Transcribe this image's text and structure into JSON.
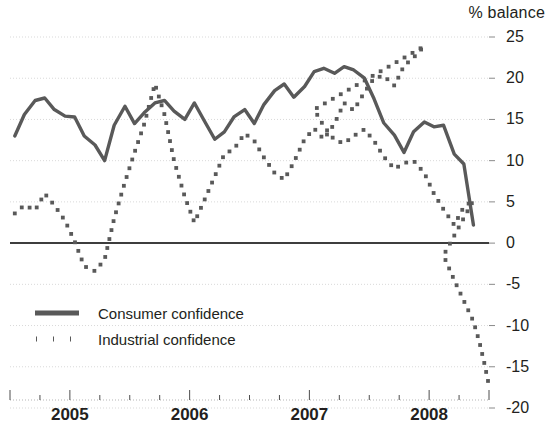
{
  "chart_data": {
    "type": "line",
    "title": "",
    "subtitle": "",
    "xlabel": "",
    "ylabel": "% balance",
    "unit_label": "% balance",
    "ylim": [
      -20,
      25
    ],
    "xlim": [
      2004.5,
      2008.5
    ],
    "grid": true,
    "gridlines_y": [
      25,
      20,
      15,
      10,
      5,
      0,
      -5,
      -10,
      -15,
      -20
    ],
    "zero_line": 0,
    "legend_position": "inside-lower-left",
    "ytick_labels": [
      "25",
      "20",
      "15",
      "10",
      "5",
      "0",
      "-5",
      "-10",
      "-15",
      "-20"
    ],
    "ytick_values": [
      25,
      20,
      15,
      10,
      5,
      0,
      -5,
      -10,
      -15,
      -20
    ],
    "xtick_labels": [
      "2005",
      "2006",
      "2007",
      "2008"
    ],
    "xtick_values": [
      2005,
      2006,
      2007,
      2008
    ],
    "x": [
      2004.54,
      2004.62,
      2004.71,
      2004.79,
      2004.87,
      2004.96,
      2005.04,
      2005.12,
      2005.21,
      2005.29,
      2005.37,
      2005.46,
      2005.54,
      2005.62,
      2005.71,
      2005.79,
      2005.87,
      2005.96,
      2006.04,
      2006.12,
      2006.21,
      2006.29,
      2006.37,
      2006.46,
      2006.54,
      2006.62,
      2006.71,
      2006.79,
      2006.87,
      2006.96,
      2007.04,
      2007.12,
      2007.21,
      2007.29,
      2007.37,
      2007.46,
      2007.54,
      2007.62,
      2007.71,
      2007.79,
      2007.87,
      2007.96,
      2008.04,
      2008.12,
      2008.21,
      2008.29,
      2008.37
    ],
    "series": [
      {
        "name": "Consumer confidence",
        "style": "solid",
        "color": "#595959",
        "values": [
          13.0,
          15.6,
          17.3,
          17.6,
          16.2,
          15.4,
          15.3,
          13.0,
          11.9,
          10.0,
          14.3,
          16.6,
          14.5,
          15.8,
          17.0,
          17.3,
          16.0,
          15.0,
          17.0,
          14.9,
          12.6,
          13.5,
          15.3,
          16.2,
          14.5,
          16.8,
          18.5,
          19.3,
          17.7,
          19.0,
          20.8,
          21.2,
          20.6,
          21.4,
          21.0,
          20.0,
          17.5,
          14.6,
          13.1,
          11.0,
          13.5,
          14.7,
          14.1,
          14.3,
          10.8,
          9.6,
          2.2
        ]
      },
      {
        "name": "Industrial confidence",
        "style": "dotted",
        "color": "#595959",
        "values": [
          3.6,
          4.6,
          4.0,
          6.0,
          4.6,
          2.7,
          0.2,
          -2.8,
          -3.4,
          -2.0,
          3.0,
          7.4,
          11.0,
          14.4,
          19.3,
          15.6,
          10.0,
          5.6,
          2.5,
          5.1,
          8.1,
          10.8,
          11.4,
          13.3,
          12.4,
          10.4,
          8.5,
          7.7,
          9.8,
          12.6,
          13.9,
          12.6,
          14.5,
          17.0,
          16.1,
          18.3,
          20.0,
          20.3,
          19.1,
          21.5,
          22.5,
          23.9,
          22.2,
          20.8,
          21.3,
          19.8,
          17.6
        ]
      }
    ],
    "industrial_extension": {
      "note": "continuation of Industrial confidence after 2007 decline",
      "x": [
        2007.04,
        2007.12,
        2007.21,
        2007.29,
        2007.37,
        2007.46,
        2007.54,
        2007.62,
        2007.71,
        2007.79,
        2007.87,
        2007.96,
        2008.04,
        2008.12,
        2008.21,
        2008.29,
        2008.37
      ],
      "values": [
        16.2,
        14.2,
        12.5,
        12.1,
        13.0,
        13.8,
        12.4,
        10.5,
        9.0,
        9.7,
        10.0,
        8.5,
        6.0,
        4.1,
        2.2,
        4.4,
        5.2
      ]
    }
  },
  "legend": {
    "items": [
      {
        "label": "Consumer confidence",
        "style": "solid"
      },
      {
        "label": "Industrial confidence",
        "style": "dotted"
      }
    ]
  }
}
